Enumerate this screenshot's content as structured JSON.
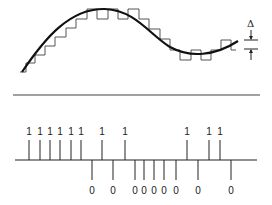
{
  "figure": {
    "step_label": "Δ",
    "colors": {
      "ink": "#1a1a1a",
      "staircase": "#555555",
      "background": "#ffffff"
    }
  },
  "top_panel": {
    "signal": "smooth analog waveform (one rise, peak, trough, partial rise)",
    "staircase_note": "step approximation with step size Δ"
  },
  "pulse_train": {
    "bits": [
      "1",
      "1",
      "1",
      "1",
      "1",
      "1",
      "0",
      "1",
      "0",
      "1",
      "0",
      "0",
      "0",
      "0",
      "0",
      "1",
      "0",
      "1",
      "1",
      "0"
    ],
    "x": [
      29,
      40,
      50,
      60,
      71,
      81,
      92,
      102,
      113,
      125,
      135,
      144,
      154,
      164,
      176,
      187,
      198,
      209,
      220,
      231
    ]
  }
}
